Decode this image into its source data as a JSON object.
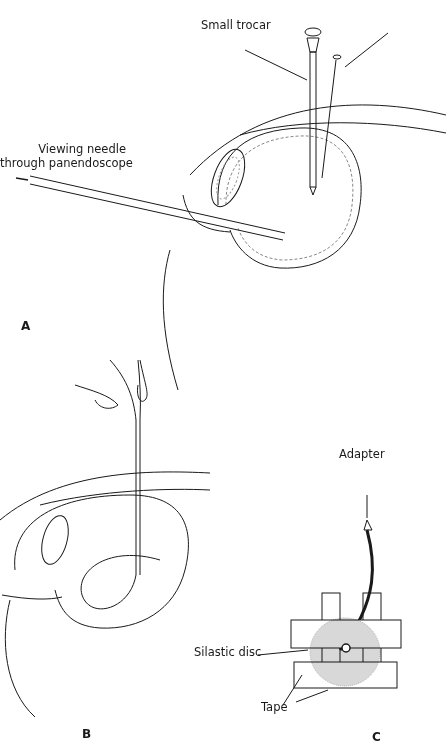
{
  "figure": {
    "panels": [
      {
        "id": "A",
        "label": "A",
        "annotations": [
          "Small trocar",
          "Viewing needle",
          "through panendoscope"
        ]
      },
      {
        "id": "B",
        "label": "B",
        "annotations": []
      },
      {
        "id": "C",
        "label": "C",
        "annotations": [
          "Adapter",
          "Silastic disc",
          "Tape"
        ]
      }
    ]
  },
  "labels": {
    "small_trocar": "Small trocar",
    "viewing_needle_line1": "Viewing needle",
    "viewing_needle_line2": "through panendoscope",
    "adapter": "Adapter",
    "silastic_disc": "Silastic disc",
    "tape": "Tape",
    "panel_a": "A",
    "panel_b": "B",
    "panel_c": "C"
  },
  "colors": {
    "line": "#1a1a1a",
    "stipple": "#bdbdbd"
  }
}
